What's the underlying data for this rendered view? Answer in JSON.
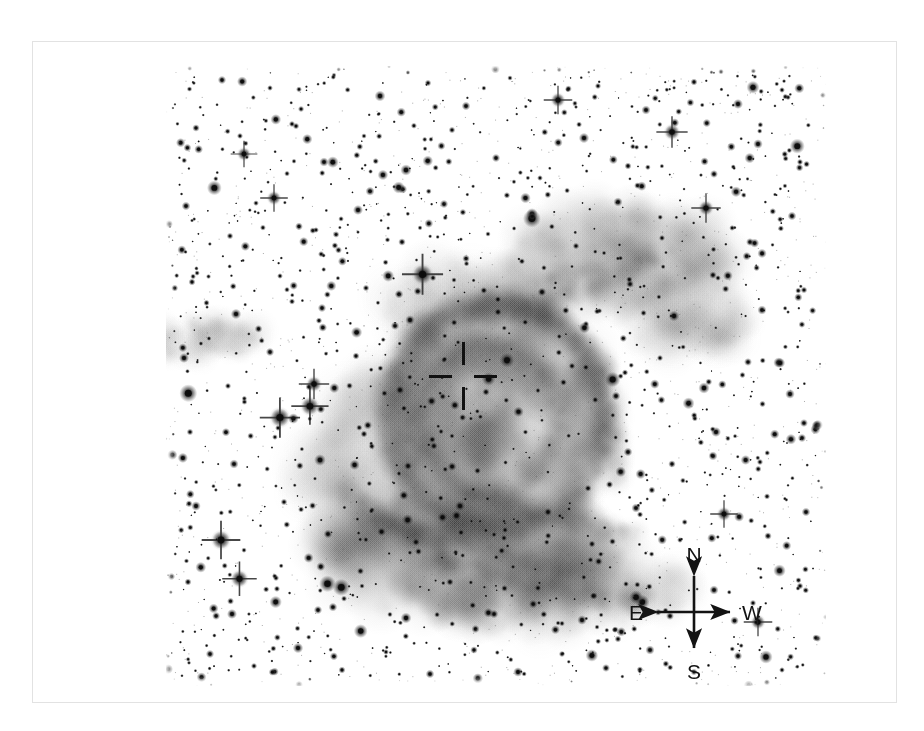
{
  "figure": {
    "kind": "astronomical-image",
    "background_color": "#ffffff",
    "ink_color": "#111111",
    "frame_color": "#e2e2e2"
  },
  "marker": {
    "name": "central-source-crosshair",
    "label": "",
    "center_x": 462,
    "center_y": 375,
    "arm_length": 34,
    "gap": 11,
    "thickness": 3,
    "color": "#111111"
  },
  "compass": {
    "name": "orientation-compass",
    "center_x": 693,
    "center_y": 611,
    "arm": 36,
    "north_label": "N",
    "south_label": "S",
    "east_label": "E",
    "west_label": "W",
    "color": "#131313"
  },
  "chart_data": {
    "type": "scatter",
    "title": "",
    "xlabel": "",
    "ylabel": "",
    "grid": false,
    "legend": null,
    "note": "Pixel coordinates are in the sky-field frame (660x620). Sizes are apparent stellar radii in px; spike=true marks stars rendered with four-point diffraction spikes.",
    "stars": [
      {
        "x": 56,
        "y": 14,
        "r": 2.0,
        "spike": false
      },
      {
        "x": 104,
        "y": 22,
        "r": 1.4,
        "spike": false
      },
      {
        "x": 168,
        "y": 9,
        "r": 1.2,
        "spike": false
      },
      {
        "x": 214,
        "y": 30,
        "r": 2.6,
        "spike": false
      },
      {
        "x": 262,
        "y": 17,
        "r": 1.6,
        "spike": false
      },
      {
        "x": 300,
        "y": 40,
        "r": 2.1,
        "spike": false
      },
      {
        "x": 344,
        "y": 12,
        "r": 1.3,
        "spike": false
      },
      {
        "x": 392,
        "y": 34,
        "r": 3.1,
        "spike": true
      },
      {
        "x": 432,
        "y": 20,
        "r": 1.5,
        "spike": false
      },
      {
        "x": 480,
        "y": 44,
        "r": 2.2,
        "spike": false
      },
      {
        "x": 528,
        "y": 16,
        "r": 1.7,
        "spike": false
      },
      {
        "x": 572,
        "y": 38,
        "r": 2.4,
        "spike": false
      },
      {
        "x": 616,
        "y": 24,
        "r": 1.4,
        "spike": false
      },
      {
        "x": 30,
        "y": 62,
        "r": 1.8,
        "spike": false
      },
      {
        "x": 78,
        "y": 88,
        "r": 2.9,
        "spike": true
      },
      {
        "x": 126,
        "y": 58,
        "r": 1.5,
        "spike": false
      },
      {
        "x": 158,
        "y": 96,
        "r": 2.2,
        "spike": false
      },
      {
        "x": 198,
        "y": 70,
        "r": 1.3,
        "spike": false
      },
      {
        "x": 240,
        "y": 104,
        "r": 2.7,
        "spike": false
      },
      {
        "x": 286,
        "y": 64,
        "r": 1.6,
        "spike": false
      },
      {
        "x": 330,
        "y": 92,
        "r": 2.0,
        "spike": false
      },
      {
        "x": 374,
        "y": 112,
        "r": 1.4,
        "spike": false
      },
      {
        "x": 418,
        "y": 72,
        "r": 2.5,
        "spike": false
      },
      {
        "x": 462,
        "y": 100,
        "r": 1.7,
        "spike": false
      },
      {
        "x": 506,
        "y": 66,
        "r": 3.4,
        "spike": true
      },
      {
        "x": 548,
        "y": 108,
        "r": 1.9,
        "spike": false
      },
      {
        "x": 592,
        "y": 78,
        "r": 2.3,
        "spike": false
      },
      {
        "x": 634,
        "y": 96,
        "r": 1.5,
        "spike": false
      },
      {
        "x": 20,
        "y": 140,
        "r": 2.1,
        "spike": false
      },
      {
        "x": 64,
        "y": 170,
        "r": 1.6,
        "spike": false
      },
      {
        "x": 108,
        "y": 132,
        "r": 3.0,
        "spike": true
      },
      {
        "x": 150,
        "y": 164,
        "r": 1.4,
        "spike": false
      },
      {
        "x": 192,
        "y": 144,
        "r": 2.4,
        "spike": false
      },
      {
        "x": 236,
        "y": 176,
        "r": 1.8,
        "spike": false
      },
      {
        "x": 278,
        "y": 138,
        "r": 2.0,
        "spike": false
      },
      {
        "x": 322,
        "y": 168,
        "r": 1.3,
        "spike": false
      },
      {
        "x": 366,
        "y": 148,
        "r": 2.8,
        "spike": false
      },
      {
        "x": 410,
        "y": 180,
        "r": 1.6,
        "spike": false
      },
      {
        "x": 452,
        "y": 136,
        "r": 2.2,
        "spike": false
      },
      {
        "x": 496,
        "y": 172,
        "r": 1.5,
        "spike": false
      },
      {
        "x": 540,
        "y": 142,
        "r": 3.2,
        "spike": true
      },
      {
        "x": 584,
        "y": 176,
        "r": 1.9,
        "spike": false
      },
      {
        "x": 626,
        "y": 150,
        "r": 2.1,
        "spike": false
      },
      {
        "x": 26,
        "y": 216,
        "r": 1.7,
        "spike": false
      },
      {
        "x": 70,
        "y": 248,
        "r": 2.5,
        "spike": false
      },
      {
        "x": 114,
        "y": 210,
        "r": 1.4,
        "spike": false
      },
      {
        "x": 156,
        "y": 242,
        "r": 2.0,
        "spike": false
      },
      {
        "x": 200,
        "y": 222,
        "r": 1.6,
        "spike": false
      },
      {
        "x": 244,
        "y": 254,
        "r": 2.3,
        "spike": false
      },
      {
        "x": 288,
        "y": 214,
        "r": 1.3,
        "spike": false
      },
      {
        "x": 332,
        "y": 246,
        "r": 1.8,
        "spike": false
      },
      {
        "x": 376,
        "y": 226,
        "r": 2.1,
        "spike": false
      },
      {
        "x": 420,
        "y": 258,
        "r": 1.5,
        "spike": false
      },
      {
        "x": 464,
        "y": 218,
        "r": 1.9,
        "spike": false
      },
      {
        "x": 508,
        "y": 250,
        "r": 2.6,
        "spike": false
      },
      {
        "x": 552,
        "y": 212,
        "r": 1.4,
        "spike": false
      },
      {
        "x": 596,
        "y": 244,
        "r": 2.2,
        "spike": false
      },
      {
        "x": 638,
        "y": 224,
        "r": 1.6,
        "spike": false
      },
      {
        "x": 18,
        "y": 292,
        "r": 2.4,
        "spike": false
      },
      {
        "x": 62,
        "y": 320,
        "r": 1.5,
        "spike": false
      },
      {
        "x": 104,
        "y": 286,
        "r": 2.0,
        "spike": false
      },
      {
        "x": 148,
        "y": 318,
        "r": 3.3,
        "spike": true
      },
      {
        "x": 190,
        "y": 290,
        "r": 1.7,
        "spike": false
      },
      {
        "x": 234,
        "y": 324,
        "r": 2.2,
        "spike": false
      },
      {
        "x": 278,
        "y": 294,
        "r": 1.4,
        "spike": false
      },
      {
        "x": 320,
        "y": 326,
        "r": 1.8,
        "spike": false
      },
      {
        "x": 406,
        "y": 300,
        "r": 1.6,
        "spike": false
      },
      {
        "x": 450,
        "y": 330,
        "r": 2.1,
        "spike": false
      },
      {
        "x": 494,
        "y": 292,
        "r": 1.5,
        "spike": false
      },
      {
        "x": 538,
        "y": 322,
        "r": 2.7,
        "spike": false
      },
      {
        "x": 582,
        "y": 296,
        "r": 1.9,
        "spike": false
      },
      {
        "x": 624,
        "y": 328,
        "r": 2.3,
        "spike": false
      },
      {
        "x": 24,
        "y": 366,
        "r": 1.6,
        "spike": false
      },
      {
        "x": 68,
        "y": 398,
        "r": 2.2,
        "spike": false
      },
      {
        "x": 112,
        "y": 362,
        "r": 1.4,
        "spike": false
      },
      {
        "x": 154,
        "y": 394,
        "r": 2.8,
        "spike": false
      },
      {
        "x": 198,
        "y": 368,
        "r": 1.7,
        "spike": false
      },
      {
        "x": 242,
        "y": 400,
        "r": 2.0,
        "spike": false
      },
      {
        "x": 286,
        "y": 370,
        "r": 1.3,
        "spike": false
      },
      {
        "x": 462,
        "y": 386,
        "r": 2.1,
        "spike": false
      },
      {
        "x": 506,
        "y": 398,
        "r": 1.8,
        "spike": false
      },
      {
        "x": 550,
        "y": 366,
        "r": 2.4,
        "spike": false
      },
      {
        "x": 594,
        "y": 396,
        "r": 1.5,
        "spike": false
      },
      {
        "x": 636,
        "y": 372,
        "r": 2.0,
        "spike": false
      },
      {
        "x": 30,
        "y": 440,
        "r": 2.3,
        "spike": false
      },
      {
        "x": 55,
        "y": 474,
        "r": 4.2,
        "spike": true
      },
      {
        "x": 118,
        "y": 436,
        "r": 1.6,
        "spike": false
      },
      {
        "x": 162,
        "y": 468,
        "r": 2.1,
        "spike": false
      },
      {
        "x": 206,
        "y": 444,
        "r": 1.4,
        "spike": false
      },
      {
        "x": 250,
        "y": 476,
        "r": 1.9,
        "spike": false
      },
      {
        "x": 294,
        "y": 440,
        "r": 2.5,
        "spike": false
      },
      {
        "x": 338,
        "y": 472,
        "r": 1.5,
        "spike": false
      },
      {
        "x": 382,
        "y": 446,
        "r": 2.0,
        "spike": false
      },
      {
        "x": 426,
        "y": 478,
        "r": 1.7,
        "spike": false
      },
      {
        "x": 470,
        "y": 442,
        "r": 2.2,
        "spike": false
      },
      {
        "x": 514,
        "y": 474,
        "r": 1.4,
        "spike": false
      },
      {
        "x": 558,
        "y": 448,
        "r": 3.0,
        "spike": true
      },
      {
        "x": 602,
        "y": 470,
        "r": 1.8,
        "spike": false
      },
      {
        "x": 640,
        "y": 446,
        "r": 2.1,
        "spike": false
      },
      {
        "x": 22,
        "y": 516,
        "r": 1.7,
        "spike": false
      },
      {
        "x": 66,
        "y": 548,
        "r": 2.4,
        "spike": false
      },
      {
        "x": 110,
        "y": 512,
        "r": 1.5,
        "spike": false
      },
      {
        "x": 152,
        "y": 544,
        "r": 2.0,
        "spike": false
      },
      {
        "x": 196,
        "y": 520,
        "r": 1.3,
        "spike": false
      },
      {
        "x": 240,
        "y": 552,
        "r": 2.6,
        "spike": false
      },
      {
        "x": 284,
        "y": 516,
        "r": 1.8,
        "spike": false
      },
      {
        "x": 328,
        "y": 548,
        "r": 2.1,
        "spike": false
      },
      {
        "x": 372,
        "y": 522,
        "r": 1.6,
        "spike": false
      },
      {
        "x": 416,
        "y": 554,
        "r": 2.3,
        "spike": false
      },
      {
        "x": 460,
        "y": 518,
        "r": 1.4,
        "spike": false
      },
      {
        "x": 504,
        "y": 550,
        "r": 1.9,
        "spike": false
      },
      {
        "x": 548,
        "y": 524,
        "r": 2.2,
        "spike": false
      },
      {
        "x": 592,
        "y": 556,
        "r": 3.1,
        "spike": true
      },
      {
        "x": 634,
        "y": 520,
        "r": 1.6,
        "spike": false
      },
      {
        "x": 44,
        "y": 588,
        "r": 2.0,
        "spike": false
      },
      {
        "x": 88,
        "y": 600,
        "r": 1.5,
        "spike": false
      },
      {
        "x": 132,
        "y": 582,
        "r": 2.5,
        "spike": false
      },
      {
        "x": 176,
        "y": 604,
        "r": 1.7,
        "spike": false
      },
      {
        "x": 220,
        "y": 586,
        "r": 1.4,
        "spike": false
      },
      {
        "x": 264,
        "y": 608,
        "r": 2.1,
        "spike": false
      },
      {
        "x": 308,
        "y": 584,
        "r": 1.8,
        "spike": false
      },
      {
        "x": 352,
        "y": 606,
        "r": 2.3,
        "spike": false
      },
      {
        "x": 396,
        "y": 588,
        "r": 1.5,
        "spike": false
      },
      {
        "x": 440,
        "y": 602,
        "r": 1.9,
        "spike": false
      },
      {
        "x": 484,
        "y": 584,
        "r": 2.2,
        "spike": false
      },
      {
        "x": 528,
        "y": 606,
        "r": 1.6,
        "spike": false
      },
      {
        "x": 572,
        "y": 590,
        "r": 2.0,
        "spike": false
      },
      {
        "x": 616,
        "y": 604,
        "r": 1.4,
        "spike": false
      }
    ],
    "nebula_components": [
      {
        "name": "main-ring-shell",
        "cx": 330,
        "cy": 352,
        "rx": 112,
        "ry": 118,
        "opacity": 0.42
      },
      {
        "name": "ring-rim-bright",
        "cx": 330,
        "cy": 352,
        "rx": 108,
        "ry": 114,
        "opacity": 0.55
      },
      {
        "name": "inner-cavity",
        "cx": 325,
        "cy": 352,
        "rx": 72,
        "ry": 78,
        "opacity": 0.18
      },
      {
        "name": "nw-wisp-extension",
        "cx": 452,
        "cy": 190,
        "rx": 110,
        "ry": 48,
        "opacity": 0.3
      },
      {
        "name": "w-faint-arc",
        "cx": 520,
        "cy": 250,
        "rx": 70,
        "ry": 34,
        "opacity": 0.2
      },
      {
        "name": "sw-filament-complex",
        "cx": 300,
        "cy": 490,
        "rx": 150,
        "ry": 62,
        "opacity": 0.38
      },
      {
        "name": "s-sweeping-arc",
        "cx": 380,
        "cy": 520,
        "rx": 140,
        "ry": 44,
        "opacity": 0.33
      },
      {
        "name": "e-outer-halo",
        "cx": 230,
        "cy": 400,
        "rx": 92,
        "ry": 96,
        "opacity": 0.22
      },
      {
        "name": "far-e-detached-wisp",
        "cx": 40,
        "cy": 272,
        "rx": 62,
        "ry": 20,
        "opacity": 0.22
      },
      {
        "name": "ne-diffuse-patch",
        "cx": 300,
        "cy": 250,
        "rx": 80,
        "ry": 50,
        "opacity": 0.2
      }
    ]
  }
}
